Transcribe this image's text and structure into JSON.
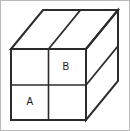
{
  "figure": {
    "shape_type": "rectangular box (cuboid) in oblique projection",
    "stroke_color": "#2b2b2b",
    "background_color": "#ffffff",
    "frame_border_color": "#b9b9b9",
    "front_face": {
      "rows": 2,
      "columns": 2,
      "cells": [
        {
          "position": "top-left",
          "label": ""
        },
        {
          "position": "top-right",
          "label": "B"
        },
        {
          "position": "bottom-left",
          "label": "A"
        },
        {
          "position": "bottom-right",
          "label": ""
        }
      ]
    },
    "top_face": {
      "rows": 1,
      "columns": 2
    },
    "right_face": {
      "rows": 2,
      "columns": 1
    },
    "labels": {
      "a": "A",
      "b": "B"
    },
    "geometry": {
      "front_top_left": "10,48",
      "front_top_right": "85,48",
      "front_bottom_left": "10,119",
      "front_bottom_right": "85,119",
      "depth_offset_x": 32,
      "depth_offset_y": -39,
      "front_mid_x": 47.5,
      "front_mid_y": 84
    }
  }
}
